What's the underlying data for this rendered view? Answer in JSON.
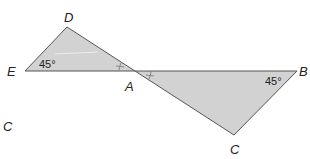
{
  "figure": {
    "fill_color": "#d2d2d2",
    "stroke_color": "#555555",
    "triangles": [
      {
        "name": "triangle-DEA",
        "vertices": [
          "D",
          "E",
          "A"
        ]
      },
      {
        "name": "triangle-ABC",
        "vertices": [
          "A",
          "B",
          "C"
        ]
      }
    ],
    "points": {
      "D": {
        "label": "D",
        "x": 67,
        "y": 27
      },
      "E": {
        "label": "E",
        "x": 25,
        "y": 71
      },
      "A": {
        "label": "A",
        "x": 135,
        "y": 71
      },
      "B": {
        "label": "B",
        "x": 297,
        "y": 71
      },
      "C": {
        "label": "C",
        "x": 234,
        "y": 135
      }
    },
    "angles": {
      "E": "45°",
      "B": "45°"
    },
    "congruent_marks": "vertical angles at A marked congruent",
    "stray_label": "C"
  }
}
